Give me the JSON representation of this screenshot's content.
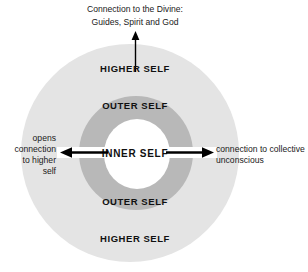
{
  "diagram": {
    "title_caption": {
      "line1": "Connection to the Divine:",
      "line2": "Guides, Spirit and God"
    },
    "rings": {
      "higher_self_top": "HIGHER SELF",
      "outer_self_top": "OUTER SELF",
      "inner_self": "INNER SELF",
      "outer_self_bottom": "OUTER SELF",
      "higher_self_bottom": "HIGHER SELF"
    },
    "left_caption": {
      "line1": "opens",
      "line2": "connection",
      "line3": "to higher",
      "line4": "self"
    },
    "right_caption": {
      "line1": "connection to collective",
      "line2": "unconscious"
    },
    "colors": {
      "outer_ring": "#e4e4e4",
      "middle_ring": "#b8b8b8",
      "inner_circle": "#ffffff",
      "text": "#101010",
      "arrow": "#000000",
      "background": "#ffffff"
    },
    "arrows": {
      "up_label": "arrow-up-to-divine",
      "left_label": "arrow-left-to-higher-self",
      "right_label": "arrow-right-to-collective-unconscious"
    }
  }
}
